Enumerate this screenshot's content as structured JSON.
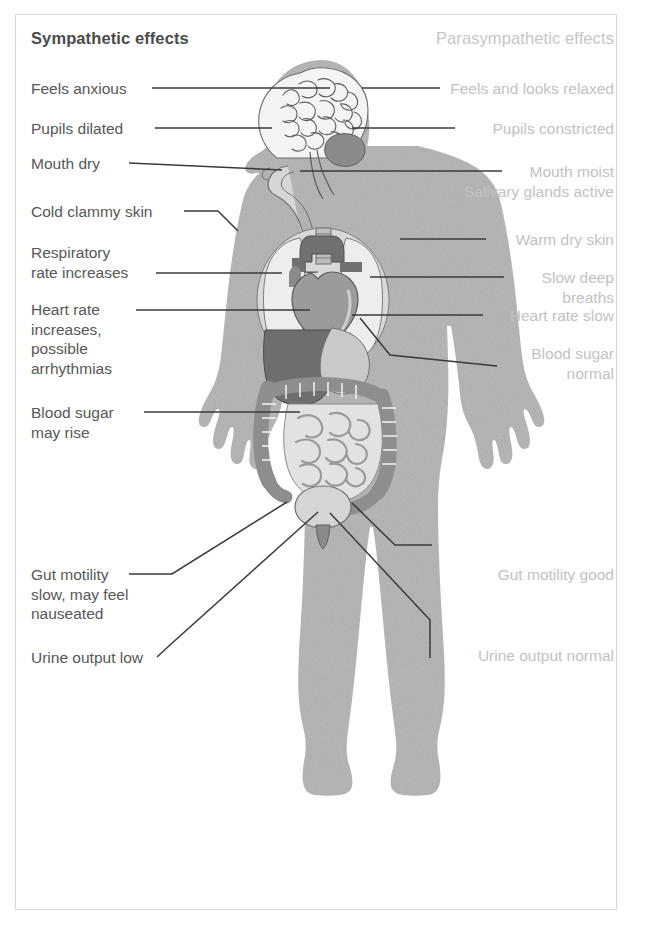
{
  "figure": {
    "title_left": "Sympathetic effects",
    "title_right": "Parasympathetic effects",
    "colors": {
      "sympathetic_text": "#575757",
      "parasympathetic_text": "#c2c2c2",
      "body_fill": "#b9b9b9",
      "leader_line": "#3a3a3a",
      "frame": "#d8d8d8",
      "background": "#ffffff",
      "heart": "#9a9a9a",
      "liver": "#6e6e6e",
      "lung": "#ededed",
      "colon": "#8e8e8e",
      "small_intestine": "#e2e2e2",
      "bladder": "#d5d5d5",
      "brain": "#f4f4f4",
      "vessels": "#707070"
    }
  },
  "sympathetic": {
    "items": [
      {
        "id": "feels-anxious",
        "text": "Feels anxious"
      },
      {
        "id": "pupils-dilated",
        "text": "Pupils dilated"
      },
      {
        "id": "mouth-dry",
        "text": "Mouth dry"
      },
      {
        "id": "cold-clammy-skin",
        "text": "Cold clammy skin"
      },
      {
        "id": "respiratory-rate",
        "text": "Respiratory\nrate increases"
      },
      {
        "id": "heart-rate",
        "text": "Heart rate\nincreases,\npossible\narrhythmias"
      },
      {
        "id": "blood-sugar",
        "text": "Blood sugar\nmay rise"
      },
      {
        "id": "gut-motility",
        "text": "Gut motility\nslow, may feel\nnauseated"
      },
      {
        "id": "urine-output",
        "text": "Urine output low"
      }
    ]
  },
  "parasympathetic": {
    "items": [
      {
        "id": "feels-relaxed",
        "text": "Feels and looks relaxed"
      },
      {
        "id": "pupils-constricted",
        "text": "Pupils constricted"
      },
      {
        "id": "mouth-moist",
        "text": "Mouth moist"
      },
      {
        "id": "salivary-glands",
        "text": "Salivary glands active"
      },
      {
        "id": "warm-dry-skin",
        "text": "Warm dry skin"
      },
      {
        "id": "slow-deep-breaths",
        "text": "Slow deep\nbreaths"
      },
      {
        "id": "heart-rate-slow",
        "text": "Heart rate slow"
      },
      {
        "id": "blood-sugar-normal",
        "text": "Blood sugar\nnormal"
      },
      {
        "id": "gut-motility-good",
        "text": "Gut motility good"
      },
      {
        "id": "urine-output-normal",
        "text": "Urine output normal"
      }
    ]
  }
}
